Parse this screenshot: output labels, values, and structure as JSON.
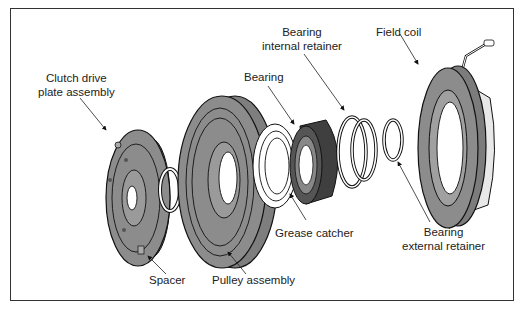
{
  "figure": {
    "colors": {
      "part_fill": "#8c8c8c",
      "part_light": "#a6a6a6",
      "bearing_dark": "#4a4a4a",
      "outline": "#111111",
      "frame": "#333333"
    }
  },
  "labels": {
    "clutch_drive_plate": {
      "line1": "Clutch drive",
      "line2": "plate assembly"
    },
    "bearing": "Bearing",
    "bearing_internal_retainer": {
      "line1": "Bearing",
      "line2": "internal retainer"
    },
    "field_coil": "Field coil",
    "grease_catcher": "Grease catcher",
    "bearing_external_retainer": {
      "line1": "Bearing",
      "line2": "external retainer"
    },
    "spacer": "Spacer",
    "pulley_assembly": "Pulley assembly"
  }
}
